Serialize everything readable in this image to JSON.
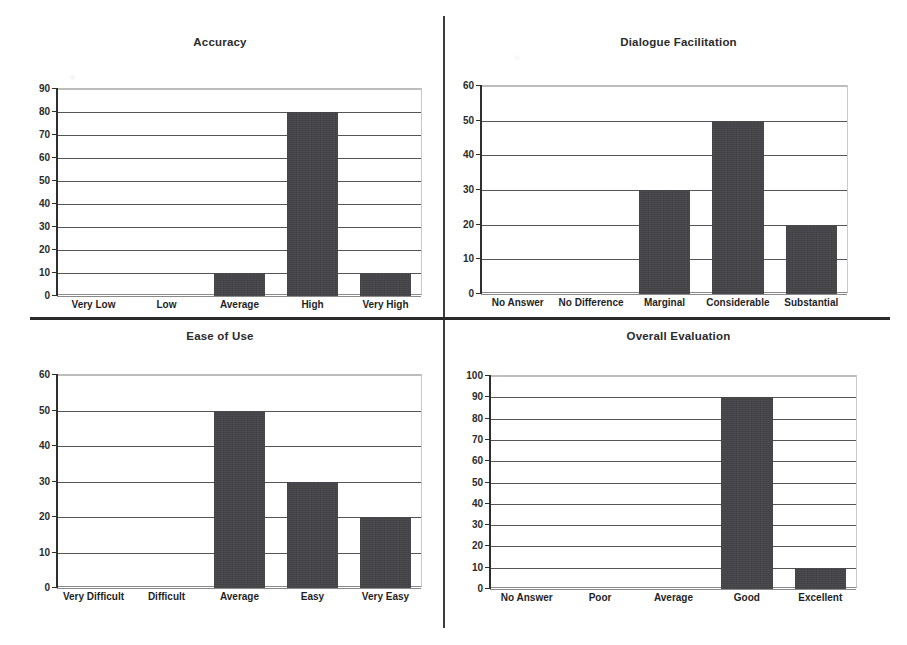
{
  "figure": {
    "background_color": "#ffffff",
    "bar_color": "#444448",
    "axis_color": "#2f2f2f",
    "gridline_color": "#555555"
  },
  "chart_data": [
    {
      "id": "accuracy",
      "type": "bar",
      "title": "Accuracy",
      "xlabel": "",
      "ylabel": "",
      "categories": [
        "Very Low",
        "Low",
        "Average",
        "High",
        "Very High"
      ],
      "values": [
        0,
        0,
        10,
        80,
        10
      ],
      "ylim": [
        0,
        90
      ],
      "ytick_step": 10,
      "yticks": [
        0,
        10,
        20,
        30,
        40,
        50,
        60,
        70,
        80,
        90
      ],
      "grid": true,
      "legend": "none"
    },
    {
      "id": "dialogue-facilitation",
      "type": "bar",
      "title": "Dialogue Facilitation",
      "xlabel": "",
      "ylabel": "",
      "categories": [
        "No Answer",
        "No Difference",
        "Marginal",
        "Considerable",
        "Substantial"
      ],
      "values": [
        0,
        0,
        30,
        50,
        20
      ],
      "ylim": [
        0,
        60
      ],
      "ytick_step": 10,
      "yticks": [
        0,
        10,
        20,
        30,
        40,
        50,
        60
      ],
      "grid": true,
      "legend": "none"
    },
    {
      "id": "ease-of-use",
      "type": "bar",
      "title": "Ease of Use",
      "xlabel": "",
      "ylabel": "",
      "categories": [
        "Very Difficult",
        "Difficult",
        "Average",
        "Easy",
        "Very Easy"
      ],
      "values": [
        0,
        0,
        50,
        30,
        20
      ],
      "ylim": [
        0,
        60
      ],
      "ytick_step": 10,
      "yticks": [
        0,
        10,
        20,
        30,
        40,
        50,
        60
      ],
      "grid": true,
      "legend": "none"
    },
    {
      "id": "overall-evaluation",
      "type": "bar",
      "title": "Overall Evaluation",
      "xlabel": "",
      "ylabel": "",
      "categories": [
        "No Answer",
        "Poor",
        "Average",
        "Good",
        "Excellent"
      ],
      "values": [
        0,
        0,
        0,
        90,
        10
      ],
      "ylim": [
        0,
        100
      ],
      "ytick_step": 10,
      "yticks": [
        0,
        10,
        20,
        30,
        40,
        50,
        60,
        70,
        80,
        90,
        100
      ],
      "grid": true,
      "legend": "none"
    }
  ]
}
